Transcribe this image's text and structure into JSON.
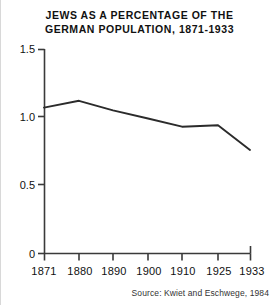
{
  "figure": {
    "title_line_1": "JEWS AS A PERCENTAGE OF THE",
    "title_line_2": "GERMAN  POPULATION, 1871-1933",
    "source": "Source: Kwiet and Eschwege, 1984",
    "axis_color": "#3a3a3a",
    "line_color": "#2b2b2b",
    "background": "#ffffff"
  },
  "chart_data": {
    "type": "line",
    "title": "JEWS AS A PERCENTAGE OF THE GERMAN POPULATION, 1871-1933",
    "xlabel": "",
    "ylabel": "",
    "x": [
      1871,
      1880,
      1890,
      1900,
      1910,
      1925,
      1933
    ],
    "categories": [
      "1871",
      "1880",
      "1890",
      "1900",
      "1910",
      "1925",
      "1933"
    ],
    "values": [
      1.07,
      1.12,
      1.05,
      0.99,
      0.93,
      0.94,
      0.76
    ],
    "series": [
      {
        "name": "Jews as a percentage of the German population",
        "values": [
          1.07,
          1.12,
          1.05,
          0.99,
          0.93,
          0.94,
          0.76
        ]
      }
    ],
    "ylim": [
      0,
      1.5
    ],
    "yticks": [
      0,
      0.5,
      1.0,
      1.5
    ],
    "ytick_labels": [
      "0",
      "0.5",
      "1.0",
      "1.5"
    ],
    "xticks": [
      1871,
      1880,
      1890,
      1900,
      1910,
      1925,
      1933
    ],
    "xtick_labels": [
      "1871",
      "1880",
      "1890",
      "1900",
      "1910",
      "1925",
      "1933"
    ],
    "xtick_positions_px": [
      43,
      78,
      112,
      147,
      181,
      217,
      249
    ],
    "grid": false,
    "legend": false,
    "legend_position": "none",
    "annotations": [
      "Source: Kwiet and Eschwege, 1984"
    ]
  }
}
